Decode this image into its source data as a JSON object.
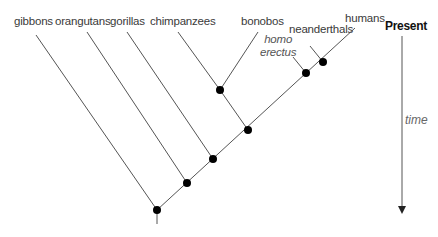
{
  "diagram": {
    "type": "cladogram",
    "taxa": [
      {
        "name": "gibbons",
        "style": "normal"
      },
      {
        "name": "orangutans",
        "style": "normal"
      },
      {
        "name": "gorillas",
        "style": "normal"
      },
      {
        "name": "chimpanzees",
        "style": "normal"
      },
      {
        "name": "bonobos",
        "style": "normal"
      },
      {
        "name": "homo erectus",
        "line1": "homo",
        "line2": "erectus",
        "style": "italic"
      },
      {
        "name": "neanderthals",
        "style": "normal"
      },
      {
        "name": "humans",
        "style": "normal"
      }
    ],
    "time_axis": {
      "top_label": "Present",
      "axis_label": "time",
      "direction": "down"
    },
    "nodes": 7,
    "colors": {
      "line": "#555555",
      "node": "#000000",
      "text": "#3a3a3a"
    }
  }
}
